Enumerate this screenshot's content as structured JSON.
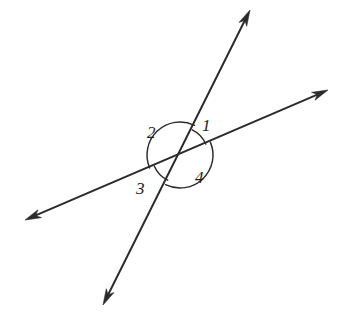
{
  "figure": {
    "type": "geometry-diagram",
    "canvas": {
      "width": 339,
      "height": 332
    },
    "background_color": "#ffffff",
    "stroke_color": "#2b2b2b",
    "label_color": "#1c1c1c"
  },
  "intersection": {
    "x": 180,
    "y": 155
  },
  "lines": [
    {
      "name": "steep-line",
      "from": {
        "x": 103,
        "y": 305
      },
      "to": {
        "x": 250,
        "y": 10
      },
      "arrow_start": true,
      "arrow_end": true
    },
    {
      "name": "shallow-line",
      "from": {
        "x": 25,
        "y": 220
      },
      "to": {
        "x": 328,
        "y": 90
      },
      "arrow_start": true,
      "arrow_end": true
    }
  ],
  "angles": [
    {
      "id": "1",
      "label": "1",
      "label_x": 202,
      "label_y": 117,
      "arc_kind": "small",
      "arc_radius": 28,
      "start_deg": 296,
      "end_deg": 337
    },
    {
      "id": "2",
      "label": "2",
      "label_x": 147,
      "label_y": 124,
      "arc_kind": "large",
      "arc_radius": 33,
      "start_deg": 157,
      "end_deg": 296
    },
    {
      "id": "3",
      "label": "3",
      "label_x": 136,
      "label_y": 180,
      "arc_kind": "small",
      "arc_radius": 28,
      "start_deg": 116,
      "end_deg": 157
    },
    {
      "id": "4",
      "label": "4",
      "label_x": 195,
      "label_y": 169,
      "arc_kind": "large",
      "arc_radius": 33,
      "start_deg": 337,
      "end_deg": 116
    }
  ]
}
